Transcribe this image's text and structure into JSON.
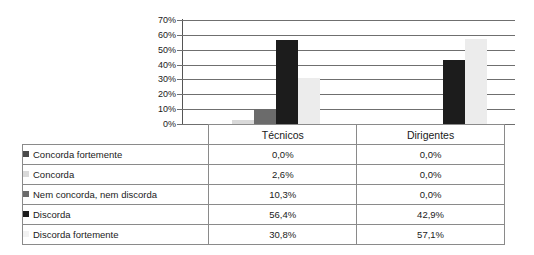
{
  "chart_data": {
    "type": "bar",
    "title": "",
    "xlabel": "",
    "ylabel": "",
    "ylim": [
      0,
      70
    ],
    "grid": true,
    "legend_position": "table-left",
    "categories": [
      "Técnicos",
      "Dirigentes"
    ],
    "ticks": [
      "0%",
      "10%",
      "20%",
      "30%",
      "40%",
      "50%",
      "60%",
      "70%"
    ],
    "tick_values": [
      0,
      10,
      20,
      30,
      40,
      50,
      60,
      70
    ],
    "series": [
      {
        "name": "Concorda fortemente",
        "color": "#4a4a4a",
        "values": [
          0.0,
          0.0
        ],
        "labels": [
          "0,0%",
          "0,0%"
        ]
      },
      {
        "name": "Concorda",
        "color": "#d9d9d9",
        "values": [
          2.6,
          0.0
        ],
        "labels": [
          "2,6%",
          "0,0%"
        ]
      },
      {
        "name": "Nem concorda, nem discorda",
        "color": "#6b6b6b",
        "values": [
          10.3,
          0.0
        ],
        "labels": [
          "10,3%",
          "0,0%"
        ]
      },
      {
        "name": "Discorda",
        "color": "#1c1c1c",
        "values": [
          56.4,
          42.9
        ],
        "labels": [
          "56,4%",
          "42,9%"
        ]
      },
      {
        "name": "Discorda fortemente",
        "color": "#f2f2f2",
        "values": [
          30.8,
          57.1
        ],
        "labels": [
          "30,8%",
          "57,1%"
        ]
      }
    ]
  },
  "table": {
    "header": {
      "label_col": "",
      "columns": [
        "Técnicos",
        "Dirigentes"
      ]
    },
    "rows": [
      {
        "label": "Concorda fortemente",
        "tecnicos": "0,0%",
        "dirigentes": "0,0%"
      },
      {
        "label": "Concorda",
        "tecnicos": "2,6%",
        "dirigentes": "0,0%"
      },
      {
        "label": "Nem concorda, nem discorda",
        "tecnicos": "10,3%",
        "dirigentes": "0,0%"
      },
      {
        "label": "Discorda",
        "tecnicos": "56,4%",
        "dirigentes": "42,9%"
      },
      {
        "label": "Discorda fortemente",
        "tecnicos": "30,8%",
        "dirigentes": "57,1%"
      }
    ]
  },
  "axis": {
    "labels": [
      "70%",
      "60%",
      "50%",
      "40%",
      "30%",
      "20%",
      "10%",
      "0%"
    ]
  }
}
